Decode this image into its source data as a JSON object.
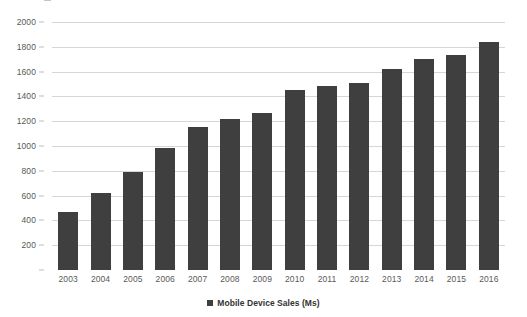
{
  "chart_data": {
    "type": "bar",
    "title": "",
    "subtitle": "",
    "xlabel": "",
    "ylabel": "",
    "categories": [
      "2003",
      "2004",
      "2005",
      "2006",
      "2007",
      "2008",
      "2009",
      "2010",
      "2011",
      "2012",
      "2013",
      "2014",
      "2015",
      "2016"
    ],
    "values": [
      465,
      625,
      790,
      985,
      1150,
      1215,
      1265,
      1450,
      1480,
      1505,
      1625,
      1700,
      1730,
      1840
    ],
    "series": [
      {
        "name": "Mobile Device Sales (Ms)",
        "values": [
          465,
          625,
          790,
          985,
          1150,
          1215,
          1265,
          1450,
          1480,
          1505,
          1625,
          1700,
          1730,
          1840
        ]
      }
    ],
    "ylim": [
      0,
      2000
    ],
    "y_ticks": [
      0,
      200,
      400,
      600,
      800,
      1000,
      1200,
      1400,
      1600,
      1800,
      2000
    ],
    "y_tick_labels": [
      "",
      "200",
      "400",
      "600",
      "800",
      "1000",
      "1200",
      "1400",
      "1600",
      "1800",
      "2000"
    ],
    "grid": true,
    "grid_axis": "y",
    "legend_position": "bottom",
    "legend_entries": [
      "Mobile Device Sales (Ms)"
    ],
    "bar_color": "#3f3f3f",
    "gridline_color": "#d6d6d6",
    "background_color": "#ffffff",
    "tick_label_color": "#595959"
  },
  "legend": {
    "label": "Mobile Device Sales (Ms)",
    "marker_icon": "square-marker-icon"
  }
}
